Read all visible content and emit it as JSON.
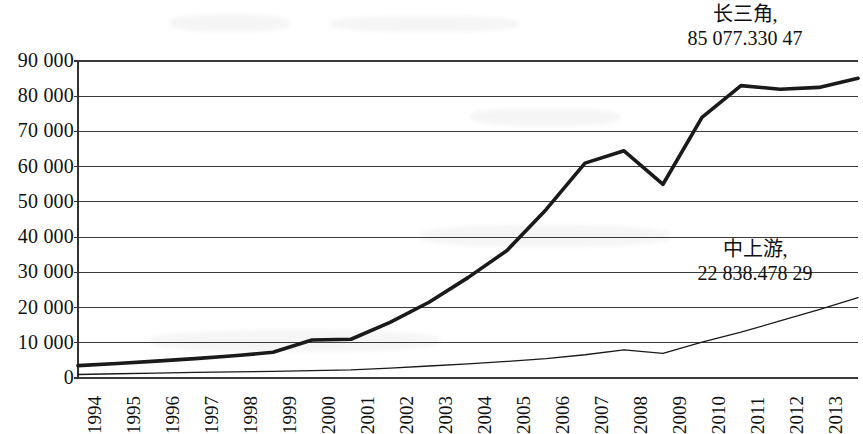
{
  "chart_data": {
    "type": "line",
    "title": "",
    "xlabel": "",
    "ylabel": "",
    "x": [
      1994,
      1995,
      1996,
      1997,
      1998,
      1999,
      2000,
      2001,
      2002,
      2003,
      2004,
      2005,
      2006,
      2007,
      2008,
      2009,
      2010,
      2011,
      2012,
      2013,
      2014
    ],
    "categories": [
      "1994",
      "1995",
      "1996",
      "1997",
      "1998",
      "1999",
      "2000",
      "2001",
      "2002",
      "2003",
      "2004",
      "2005",
      "2006",
      "2007",
      "2008",
      "2009",
      "2010",
      "2011",
      "2012",
      "2013",
      "2014"
    ],
    "ylim": [
      0,
      90000
    ],
    "ytick_values": [
      0,
      10000,
      20000,
      30000,
      40000,
      50000,
      60000,
      70000,
      80000,
      90000
    ],
    "ytick_labels": [
      "0",
      "10 000",
      "20 000",
      "30 000",
      "40 000",
      "50 000",
      "60 000",
      "70 000",
      "80 000",
      "90 000"
    ],
    "grid": true,
    "grid_axis": "y",
    "legend": "none",
    "series": [
      {
        "name": "长三角",
        "end_value_label": "85 077.330 47",
        "style": "thick",
        "color": "#1a1a1a",
        "width": 3.6,
        "values": [
          3500,
          4100,
          4800,
          5500,
          6300,
          7300,
          10800,
          11000,
          15800,
          21500,
          28500,
          36200,
          47800,
          61000,
          64500,
          55000,
          74000,
          83000,
          82000,
          82500,
          85077
        ]
      },
      {
        "name": "中上游",
        "end_value_label": "22 838.478 29",
        "style": "thin",
        "color": "#1a1a1a",
        "width": 1.3,
        "values": [
          1000,
          1200,
          1400,
          1600,
          1750,
          1900,
          2100,
          2300,
          2800,
          3400,
          4000,
          4700,
          5500,
          6600,
          8000,
          7000,
          10200,
          13000,
          16200,
          19400,
          22838
        ]
      }
    ],
    "annotations": [
      {
        "id": "top",
        "name": "长三角,",
        "value": "85 077.330 47"
      },
      {
        "id": "bottom",
        "name": "中上游,",
        "value": "22 838.478 29"
      }
    ]
  },
  "axes": {
    "plot_left": 78,
    "plot_right": 858,
    "plot_top": 61,
    "plot_bottom": 378,
    "axis_color": "#333333",
    "grid_color": "#3a3a3a"
  }
}
